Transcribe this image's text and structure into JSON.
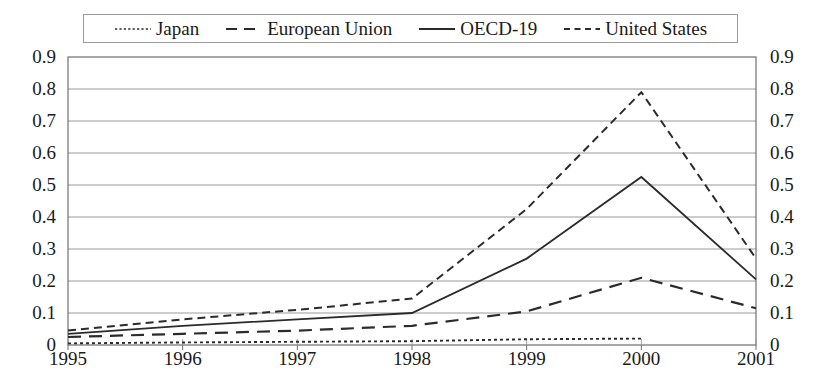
{
  "chart_data": {
    "type": "line",
    "title": "",
    "subtitle": "",
    "xlabel": "",
    "ylabel": "",
    "x": [
      1995,
      1996,
      1997,
      1998,
      1999,
      2000,
      2001
    ],
    "categories": [
      "1995",
      "1996",
      "1997",
      "1998",
      "1999",
      "2000",
      "2001"
    ],
    "ylim": [
      0,
      0.9
    ],
    "yticks": [
      0,
      0.1,
      0.2,
      0.3,
      0.4,
      0.5,
      0.6,
      0.7,
      0.8,
      0.9
    ],
    "ytick_labels": [
      "0",
      "0.1",
      "0.2",
      "0.3",
      "0.4",
      "0.5",
      "0.6",
      "0.7",
      "0.8",
      "0.9"
    ],
    "xtick_labels": [
      "1995",
      "1996",
      "1997",
      "1998",
      "1999",
      "2000",
      "2001"
    ],
    "dual_y_axis": true,
    "grid": "horizontal",
    "legend_position": "top",
    "series": [
      {
        "name": "Japan",
        "style": "dotted",
        "color": "#2b2b2b",
        "x": [
          1995,
          1996,
          1997,
          1998,
          1999,
          2000
        ],
        "values": [
          0.005,
          0.008,
          0.01,
          0.012,
          0.018,
          0.02
        ]
      },
      {
        "name": "European Union",
        "style": "long-dash",
        "color": "#2b2b2b",
        "x": [
          1995,
          1996,
          1997,
          1998,
          1999,
          2000,
          2001
        ],
        "values": [
          0.025,
          0.035,
          0.045,
          0.06,
          0.105,
          0.21,
          0.115
        ]
      },
      {
        "name": "OECD-19",
        "style": "solid",
        "color": "#2b2b2b",
        "x": [
          1995,
          1996,
          1997,
          1998,
          1999,
          2000,
          2001
        ],
        "values": [
          0.035,
          0.06,
          0.08,
          0.1,
          0.27,
          0.525,
          0.205
        ]
      },
      {
        "name": "United States",
        "style": "dash",
        "color": "#2b2b2b",
        "x": [
          1995,
          1996,
          1997,
          1998,
          1999,
          2000,
          2001
        ],
        "values": [
          0.045,
          0.08,
          0.11,
          0.145,
          0.425,
          0.79,
          0.27
        ]
      }
    ]
  },
  "legend": {
    "items": [
      {
        "label": "Japan",
        "style": "dotted"
      },
      {
        "label": "European Union",
        "style": "long-dash"
      },
      {
        "label": "OECD-19",
        "style": "solid"
      },
      {
        "label": "United States",
        "style": "dash"
      }
    ]
  },
  "axes": {
    "left_labels": [
      "0.9",
      "0.8",
      "0.7",
      "0.6",
      "0.5",
      "0.4",
      "0.3",
      "0.2",
      "0.1",
      "0"
    ],
    "right_labels": [
      "0.9",
      "0.8",
      "0.7",
      "0.6",
      "0.5",
      "0.4",
      "0.3",
      "0.2",
      "0.1",
      "0"
    ],
    "bottom_labels": [
      "1995",
      "1996",
      "1997",
      "1998",
      "1999",
      "2000",
      "2001"
    ]
  },
  "colors": {
    "axis": "#6f6f6f",
    "grid": "#9a9a9a",
    "line": "#2b2b2b",
    "text": "#1a1a1a",
    "background": "#ffffff"
  }
}
